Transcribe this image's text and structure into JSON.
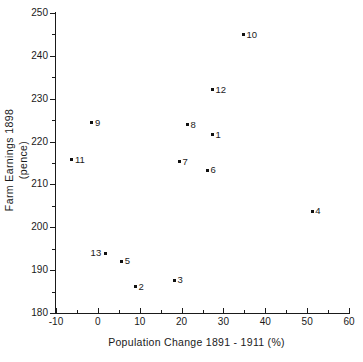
{
  "chart_data": {
    "type": "scatter",
    "title": "",
    "xlabel": "Population  Change   1891 - 1911 (%)",
    "ylabel_line1": "Farm  Earnings  1898",
    "ylabel_line2": "(pence)",
    "xlim": [
      -10,
      60
    ],
    "ylim": [
      180,
      250
    ],
    "x_major_ticks": [
      -10,
      0,
      10,
      20,
      30,
      40,
      50,
      60
    ],
    "x_minor_ticks": [
      -5,
      5,
      15,
      25,
      35,
      45,
      55
    ],
    "y_major_ticks": [
      180,
      190,
      200,
      210,
      220,
      230,
      240,
      250
    ],
    "y_minor_ticks": [
      185,
      195,
      205,
      215,
      225,
      235,
      245
    ],
    "x_tick_labels": [
      "-10",
      "0",
      "10",
      "20",
      "30",
      "40",
      "50",
      "60"
    ],
    "y_tick_labels": [
      "180",
      "190",
      "200",
      "210",
      "220",
      "230",
      "240",
      "250"
    ],
    "grid": false,
    "legend": "none",
    "marker_color": "#111111",
    "axis_color": "#1a1a1a",
    "background_color": "#ffffff",
    "points": [
      {
        "label": "1",
        "x": 27.4,
        "y": 221.6,
        "label_side": "right"
      },
      {
        "label": "2",
        "x": 9.0,
        "y": 186.1,
        "label_side": "right"
      },
      {
        "label": "3",
        "x": 18.3,
        "y": 187.7,
        "label_side": "right"
      },
      {
        "label": "4",
        "x": 51.2,
        "y": 203.7,
        "label_side": "right"
      },
      {
        "label": "5",
        "x": 5.7,
        "y": 192.1,
        "label_side": "right"
      },
      {
        "label": "6",
        "x": 26.2,
        "y": 213.3,
        "label_side": "right"
      },
      {
        "label": "7",
        "x": 19.5,
        "y": 215.3,
        "label_side": "right"
      },
      {
        "label": "8",
        "x": 21.4,
        "y": 223.9,
        "label_side": "right"
      },
      {
        "label": "9",
        "x": -1.4,
        "y": 224.4,
        "label_side": "right"
      },
      {
        "label": "10",
        "x": 34.8,
        "y": 244.9,
        "label_side": "right"
      },
      {
        "label": "11",
        "x": -6.2,
        "y": 215.8,
        "label_side": "right"
      },
      {
        "label": "12",
        "x": 27.4,
        "y": 232.1,
        "label_side": "right"
      },
      {
        "label": "13",
        "x": 1.9,
        "y": 194.0,
        "label_side": "left"
      }
    ]
  }
}
